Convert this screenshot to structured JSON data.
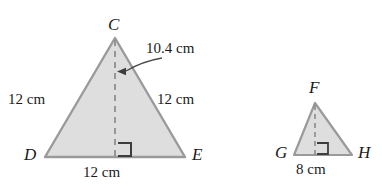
{
  "figure": {
    "colors": {
      "fill": "#dedede",
      "stroke": "#9a9a9a",
      "dash": "#8a8a8a",
      "text": "#1a1a1a",
      "background": "#ffffff"
    }
  },
  "triangle_large": {
    "name": "triangle-CDE",
    "vertices": {
      "apex": "C",
      "bottom_left": "D",
      "bottom_right": "E"
    },
    "labels": {
      "left_side": "12 cm",
      "right_side": "12 cm",
      "base": "12 cm",
      "height": "10.4 cm"
    },
    "geometry": {
      "apex_x": 115,
      "apex_y": 38,
      "left_x": 45,
      "base_y": 157,
      "right_x": 185,
      "altitude_foot_x": 115,
      "right_angle_size": 13
    }
  },
  "triangle_small": {
    "name": "triangle-FGH",
    "vertices": {
      "apex": "F",
      "bottom_left": "G",
      "bottom_right": "H"
    },
    "labels": {
      "base": "8 cm"
    },
    "geometry": {
      "apex_x": 315,
      "apex_y": 103,
      "left_x": 294,
      "base_y": 155,
      "right_x": 352,
      "altitude_foot_x": 315,
      "right_angle_size": 11
    }
  },
  "annotation": {
    "leader_label": "10.4 cm",
    "leader_points_to": "altitude-dashed-line"
  }
}
